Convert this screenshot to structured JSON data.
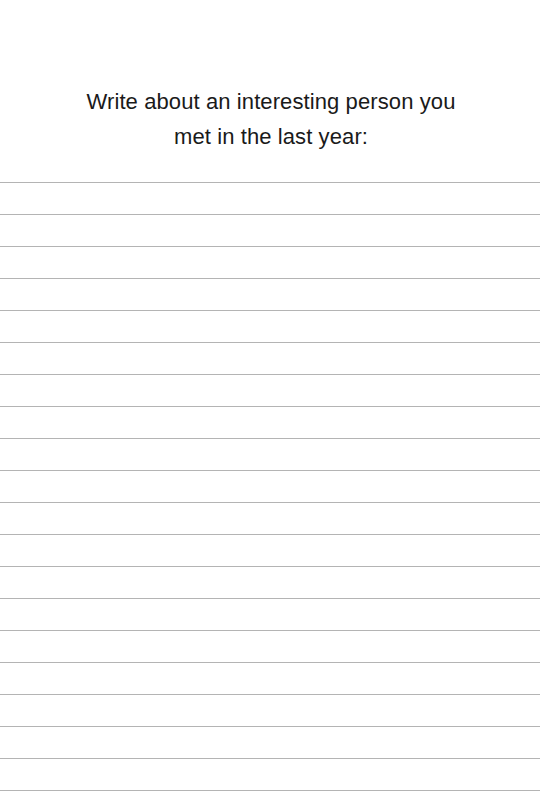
{
  "prompt": {
    "line1": "Write about an interesting person you",
    "line2": "met in the last year:"
  },
  "writing_area": {
    "line_count": 20,
    "first_line_y": 182,
    "line_spacing": 32,
    "line_color": "#b4b4b4"
  }
}
